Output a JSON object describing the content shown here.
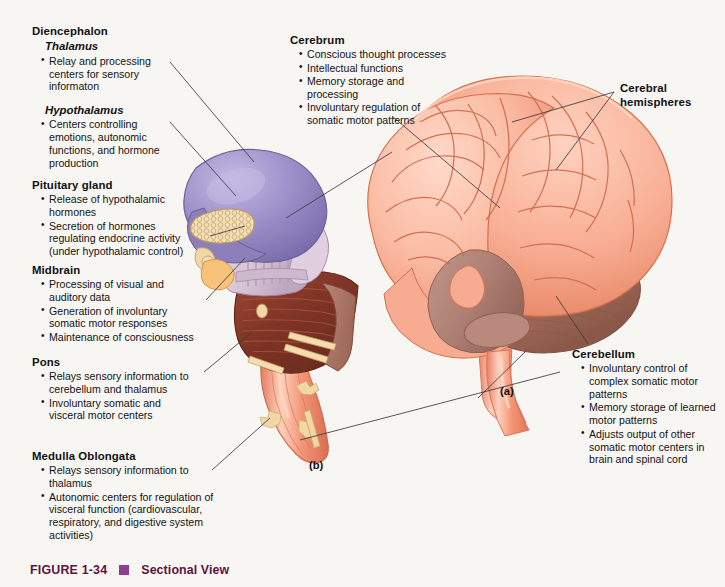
{
  "figure": {
    "number": "FIGURE 1-34",
    "title": "Sectional View",
    "accent_color": "#5d1240",
    "bullet_color": "#8a3f8f",
    "background": "#f8f6f3"
  },
  "panel_labels": {
    "a": "(a)",
    "b": "(b)"
  },
  "callouts": [
    {
      "id": "diencephalon",
      "heading": "Diencephalon",
      "subheading": "Thalamus",
      "bullets": [
        "Relay and processing centers for sensory informaton"
      ]
    },
    {
      "id": "hypothalamus",
      "heading": "",
      "subheading": "Hypothalamus",
      "bullets": [
        "Centers controlling emotions, autonomic functions, and hormone production"
      ]
    },
    {
      "id": "pituitary-gland",
      "heading": "Pituitary gland",
      "subheading": "",
      "bullets": [
        "Release of hypothalamic hormones",
        "Secretion of hormones regulating endocrine activity (under hypothalamic control)"
      ]
    },
    {
      "id": "midbrain",
      "heading": "Midbrain",
      "subheading": "",
      "bullets": [
        "Processing of visual and auditory data",
        "Generation of involuntary somatic motor responses",
        "Maintenance of consciousness"
      ]
    },
    {
      "id": "pons",
      "heading": "Pons",
      "subheading": "",
      "bullets": [
        "Relays sensory information to cerebellum and thalamus",
        "Involuntary somatic and visceral motor centers"
      ]
    },
    {
      "id": "medulla-oblongata",
      "heading": "Medulla Oblongata",
      "subheading": "",
      "bullets": [
        "Relays sensory information to thalamus",
        "Autonomic centers for regulation of visceral function (cardiovascular, respiratory, and digestive system activities)"
      ]
    },
    {
      "id": "cerebrum",
      "heading": "Cerebrum",
      "subheading": "",
      "bullets": [
        "Conscious thought processes",
        "Intellectual functions",
        "Memory storage and processing",
        "Involuntary regulation of somatic motor patterns"
      ]
    },
    {
      "id": "cerebral-hemispheres",
      "heading": "Cerebral hemispheres",
      "subheading": "",
      "bullets": []
    },
    {
      "id": "cerebellum",
      "heading": "Cerebellum",
      "subheading": "",
      "bullets": [
        "Involuntary control of complex somatic motor patterns",
        "Memory storage of learned motor patterns",
        "Adjusts output of other somatic motor centers in brain and spinal cord"
      ]
    }
  ],
  "illustration": {
    "whole_brain_label": "whole-brain-lateral-view",
    "sectional_label": "brainstem-sectional-view",
    "colors": {
      "cortex_light": "#fbc3ae",
      "cortex_mid": "#f59e82",
      "cortex_deep": "#e07a5e",
      "cortex_line": "#cf6a4d",
      "cerebellum": "#a8705f",
      "cerebellum_dark": "#8d5b4d",
      "brainstem_gray": "#b28175",
      "thalamus_purple": "#9b8fc6",
      "thalamus_purple_dark": "#7e70ab",
      "midbrain_lavender": "#d9c8d8",
      "pons_maroon": "#8a3a2b",
      "pons_maroon_dark": "#6d2a1f",
      "pons_tan": "#b07a65",
      "medulla_salmon": "#ef8c72",
      "pituitary_cream": "#f0dcb4",
      "nerve_tan": "#f4d9a8",
      "leader_line": "#3a3a42"
    }
  }
}
